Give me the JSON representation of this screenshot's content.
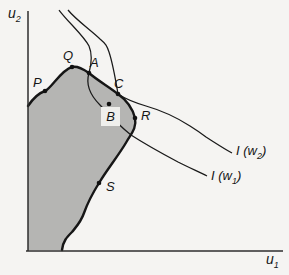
{
  "colors": {
    "background": "#f5f4f2",
    "region_fill": "#b5b5b3",
    "curve_color": "#1a1a1a",
    "axis_color": "#2e2e2e",
    "b_box_fill": "#efefec"
  },
  "axes": {
    "y_label": {
      "base": "u",
      "sub": "2"
    },
    "x_label": {
      "base": "u",
      "sub": "1"
    }
  },
  "point_labels": {
    "P": "P",
    "Q": "Q",
    "A": "A",
    "B": "B",
    "C": "C",
    "R": "R",
    "S": "S"
  },
  "curve_labels": {
    "w2": {
      "base": "I (w",
      "sub": "2",
      "close": ")"
    },
    "w1": {
      "base": "I (w",
      "sub": "1",
      "close": ")"
    }
  },
  "diagram_data": {
    "type": "economics-diagram",
    "description": "Shaded attainable utility set bounded by a thick irregular frontier in (u1,u2) space, with labelled points on and inside the frontier and two thin welfare indifference curves I(w1) and I(w2) descending from the top and sweeping to the lower right.",
    "points_px": [
      {
        "name": "P",
        "x": 45,
        "y": 91,
        "location": "frontier, left side"
      },
      {
        "name": "Q",
        "x": 72,
        "y": 67,
        "location": "frontier, local peak"
      },
      {
        "name": "A",
        "x": 89,
        "y": 73,
        "location": "frontier, crossed by I(w1)"
      },
      {
        "name": "B",
        "x": 109,
        "y": 104,
        "location": "interior, labelled in white box"
      },
      {
        "name": "C",
        "x": 118,
        "y": 94,
        "location": "frontier, touched by I(w2)"
      },
      {
        "name": "R",
        "x": 135,
        "y": 118,
        "location": "frontier, right bulge"
      },
      {
        "name": "S",
        "x": 99,
        "y": 183,
        "location": "frontier, lower left"
      }
    ],
    "curves": [
      {
        "name": "I(w2)",
        "ends_at_label": [
          236,
          152
        ]
      },
      {
        "name": "I(w1)",
        "ends_at_label": [
          211,
          177
        ]
      }
    ]
  }
}
